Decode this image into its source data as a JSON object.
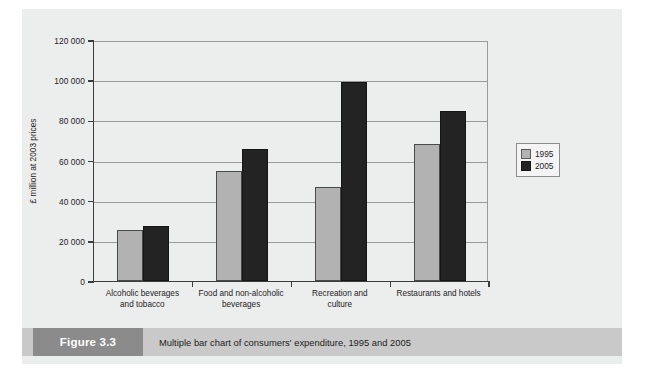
{
  "figure": {
    "tag": "Figure 3.3",
    "caption": "Multiple bar chart of consumers' expenditure, 1995 and 2005"
  },
  "chart_data": {
    "type": "bar",
    "title": "",
    "xlabel": "",
    "ylabel": "£ million at 2003 prices",
    "ylim": [
      0,
      120000
    ],
    "yticks": [
      0,
      20000,
      40000,
      60000,
      80000,
      100000,
      120000
    ],
    "ytick_labels": [
      "0",
      "20 000",
      "40 000",
      "60 000",
      "80 000",
      "100 000",
      "120 000"
    ],
    "grid": true,
    "legend_position": "right",
    "categories": [
      "Alcoholic beverages and tobacco",
      "Food and non-alcoholic beverages",
      "Recreation and culture",
      "Restaurants and hotels"
    ],
    "category_lines": [
      [
        "Alcoholic beverages",
        "and tobacco"
      ],
      [
        "Food and non-alcoholic",
        "beverages"
      ],
      [
        "Recreation and",
        "culture"
      ],
      [
        "Restaurants and hotels"
      ]
    ],
    "series": [
      {
        "name": "1995",
        "color": "#b2b2b2",
        "values": [
          25500,
          55000,
          47000,
          68000
        ]
      },
      {
        "name": "2005",
        "color": "#232323",
        "values": [
          27500,
          65500,
          99000,
          84500
        ]
      }
    ]
  }
}
